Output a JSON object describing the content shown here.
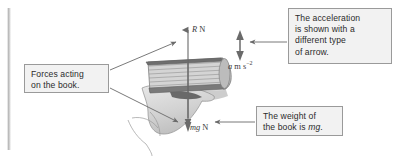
{
  "figure": {
    "background_color": "#ffffff",
    "margin_bar_color": "#c9c9c9"
  },
  "callouts": [
    {
      "id": "acceleration",
      "text": "The acceleration\nis shown with a\ndifferent type\nof arrow.",
      "fill": "#f2f2f2",
      "border": "#9a9a9a"
    },
    {
      "id": "forces",
      "text": "Forces acting\non the book.",
      "fill": "#f2f2f2",
      "border": "#9a9a9a"
    },
    {
      "id": "weight",
      "text_before": "The weight of\nthe book is ",
      "text_italic": "mg",
      "text_after": ".",
      "fill": "#f2f2f2",
      "border": "#9a9a9a"
    }
  ],
  "vectors": [
    {
      "id": "normal-reaction",
      "symbol": "R",
      "unit": "N",
      "direction": "up",
      "arrow_style": "single-head",
      "color": "#5a5a5a"
    },
    {
      "id": "acceleration",
      "symbol": "a",
      "unit": "m s",
      "exponent": "−2",
      "direction": "up",
      "arrow_style": "double-head",
      "color": "#5a5a5a"
    },
    {
      "id": "weight",
      "symbol": "mg",
      "unit": "N",
      "direction": "down",
      "arrow_style": "single-head",
      "color": "#5a5a5a"
    }
  ],
  "illustration": {
    "object": "book",
    "support": "hand",
    "book_color": "#bdbdbd",
    "page_line_color": "#8c8c8c",
    "hand_color": "#dcdcdc"
  },
  "leader_lines": [
    {
      "id": "forces-to-reaction",
      "from": "forces-callout",
      "to": "reaction-arrow"
    },
    {
      "id": "forces-to-weight",
      "from": "forces-callout",
      "to": "weight-arrow"
    },
    {
      "id": "acceleration-to-arrow",
      "from": "acceleration-callout",
      "to": "acceleration-arrow"
    },
    {
      "id": "weight-to-label",
      "from": "weight-callout",
      "to": "weight-label"
    }
  ]
}
